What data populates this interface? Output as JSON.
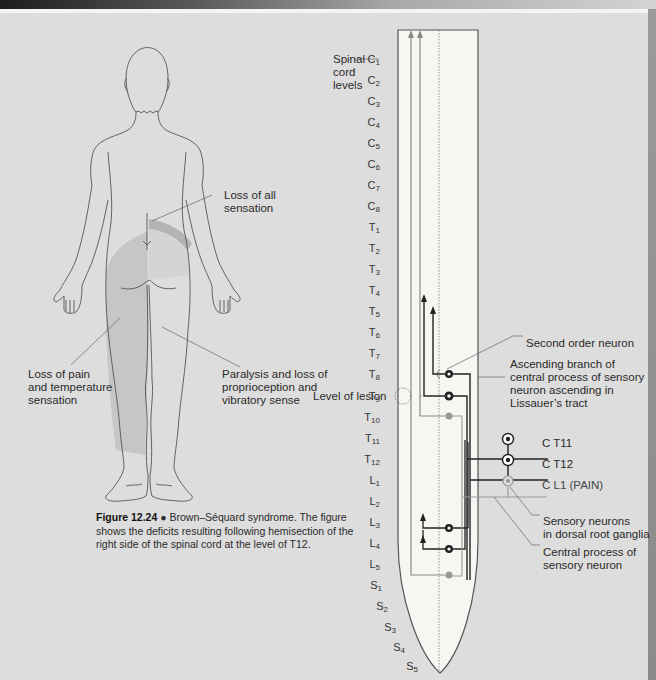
{
  "figure": {
    "number": "Figure 12.24",
    "bullet": "●",
    "caption": "Brown–Séquard syndrome. The figure shows the deficits resulting following hemisection of the right side of the spinal cord at the level of T12."
  },
  "body_labels": {
    "loss_all": [
      "Loss of all",
      "sensation"
    ],
    "loss_pain": [
      "Loss of pain",
      "and temperature",
      "sensation"
    ],
    "paralysis": [
      "Paralysis and loss of",
      "proprioception and",
      "vibratory sense"
    ]
  },
  "cord_labels": {
    "spinal_cord_levels": [
      "Spinal",
      "cord",
      "levels"
    ],
    "level_of_lesion": "Level of lesion",
    "second_order_neuron": "Second order neuron",
    "ascending_branch": [
      "Ascending branch of",
      "central process of sensory",
      "neuron ascending in",
      "Lissauer’s tract"
    ],
    "sensory_neurons": [
      "Sensory neurons",
      "in dorsal root ganglia"
    ],
    "central_process": [
      "Central process of",
      "sensory neuron"
    ],
    "root_T11": "T11",
    "root_T12": "T12",
    "root_L1": "L1 (PAIN)"
  },
  "levels": [
    {
      "l": "C",
      "n": "1"
    },
    {
      "l": "C",
      "n": "2"
    },
    {
      "l": "C",
      "n": "3"
    },
    {
      "l": "C",
      "n": "4"
    },
    {
      "l": "C",
      "n": "5"
    },
    {
      "l": "C",
      "n": "6"
    },
    {
      "l": "C",
      "n": "7"
    },
    {
      "l": "C",
      "n": "8"
    },
    {
      "l": "T",
      "n": "1"
    },
    {
      "l": "T",
      "n": "2"
    },
    {
      "l": "T",
      "n": "3"
    },
    {
      "l": "T",
      "n": "4"
    },
    {
      "l": "T",
      "n": "5"
    },
    {
      "l": "T",
      "n": "6"
    },
    {
      "l": "T",
      "n": "7"
    },
    {
      "l": "T",
      "n": "8"
    },
    {
      "l": "T",
      "n": "9"
    },
    {
      "l": "T",
      "n": "10"
    },
    {
      "l": "T",
      "n": "11"
    },
    {
      "l": "T",
      "n": "12"
    },
    {
      "l": "L",
      "n": "1"
    },
    {
      "l": "L",
      "n": "2"
    },
    {
      "l": "L",
      "n": "3"
    },
    {
      "l": "L",
      "n": "4"
    },
    {
      "l": "L",
      "n": "5"
    },
    {
      "l": "S",
      "n": "1"
    },
    {
      "l": "S",
      "n": "2"
    },
    {
      "l": "S",
      "n": "3"
    },
    {
      "l": "S",
      "n": "4"
    },
    {
      "l": "S",
      "n": "5"
    }
  ],
  "colors": {
    "background": "#dddddd",
    "cord_fill": "#f6f6f2",
    "dark_neuron": "#222222",
    "grey_neuron": "#8c8c8c",
    "shade_region": "#c4c4c4"
  }
}
